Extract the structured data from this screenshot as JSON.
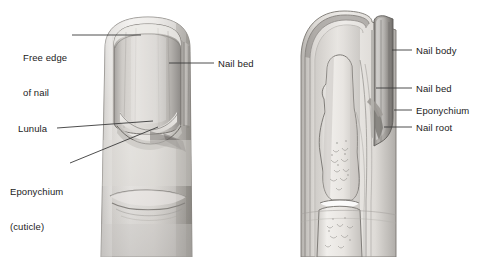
{
  "figure": {
    "background_color": "#ffffff",
    "text_color": "#1b1b1b",
    "leader_line_color": "#3a3a3a",
    "panels": [
      {
        "id": "dorsal",
        "name": "dorsal-view-of-fingertip"
      },
      {
        "id": "sagittal",
        "name": "sagittal-section-of-finger"
      }
    ]
  },
  "labels": {
    "free_edge_line1": "Free edge",
    "free_edge_line2": "of nail",
    "nail_bed_left": "Nail bed",
    "lunula": "Lunula",
    "eponychium_line1": "Eponychium",
    "eponychium_line2": "(cuticle)",
    "nail_body": "Nail body",
    "nail_bed_right": "Nail bed",
    "eponychium_right": "Eponychium",
    "nail_root": "Nail root"
  },
  "colors": {
    "skin_light": "#e9e7e4",
    "skin_mid": "#cfccc8",
    "skin_dark": "#a9a6a2",
    "nail_plate": "#b9b7b4",
    "nail_plate_dark": "#8f8d8a",
    "bone_light": "#efeeec",
    "outline": "#6e6c69"
  }
}
